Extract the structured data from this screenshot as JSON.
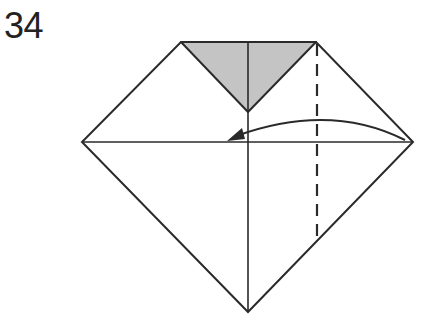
{
  "step": {
    "number": "34"
  },
  "diagram": {
    "type": "origami-fold-step",
    "colors": {
      "line": "#2a2a2a",
      "shaded_flap": "#c4c4c4",
      "paper": "#ffffff"
    },
    "elements": [
      "outline-pentagon-diamond",
      "shaded-triangle-flap",
      "horizontal-crease",
      "vertical-center-crease",
      "valley-fold-dashed-line",
      "curved-fold-arrow"
    ]
  }
}
